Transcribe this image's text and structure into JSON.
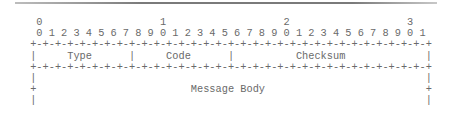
{
  "diagram": {
    "kind": "packet-header-ascii",
    "bit_ruler": {
      "tens_row": "  0                   1                   2                   3",
      "ones_row": "  0 1 2 3 4 5 6 7 8 9 0 1 2 3 4 5 6 7 8 9 0 1 2 3 4 5 6 7 8 9 0 1"
    },
    "lines": [
      " +-+-+-+-+-+-+-+-+-+-+-+-+-+-+-+-+-+-+-+-+-+-+-+-+-+-+-+-+-+-+-+-+",
      " |     Type      |     Code      |          Checksum             |",
      " +-+-+-+-+-+-+-+-+-+-+-+-+-+-+-+-+-+-+-+-+-+-+-+-+-+-+-+-+-+-+-+-+",
      " |                                                               |",
      " +                         Message Body                          +",
      " |                                                               |"
    ],
    "fields": [
      {
        "name": "Type",
        "bits": [
          0,
          7
        ]
      },
      {
        "name": "Code",
        "bits": [
          8,
          15
        ]
      },
      {
        "name": "Checksum",
        "bits": [
          16,
          31
        ]
      },
      {
        "name": "Message Body",
        "bits": [
          0,
          31
        ]
      }
    ],
    "colors": {
      "text": "#6a6a6a",
      "rule": "#7a7a7a",
      "background": "#ffffff"
    }
  }
}
